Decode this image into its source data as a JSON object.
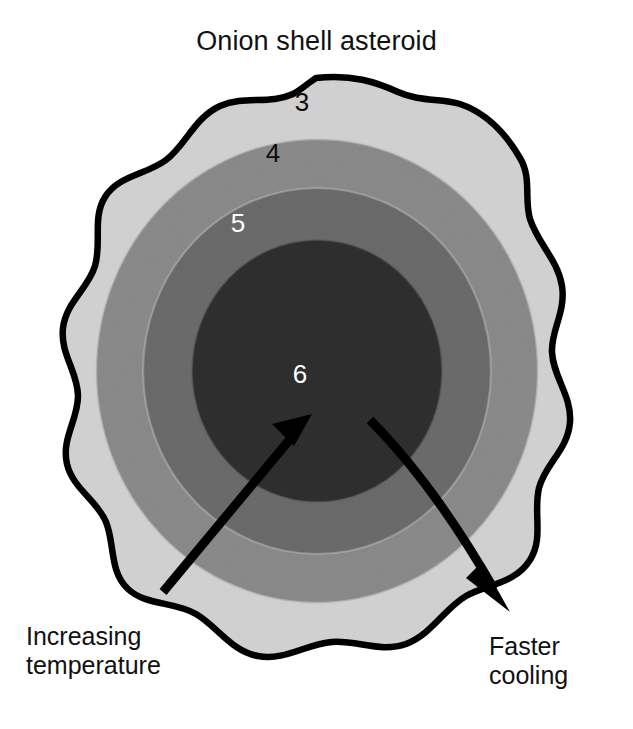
{
  "figure": {
    "title": "Onion shell asteroid",
    "type": "cross-section-diagram"
  },
  "shells": [
    {
      "id": "shell-3",
      "label": "3",
      "label_color": "#0d0d0d",
      "fill": "#d2d2d2",
      "position": "outermost shell",
      "radius_rel": 1.0
    },
    {
      "id": "shell-4",
      "label": "4",
      "label_color": "#0d0d0d",
      "fill": "#8a8a8a",
      "position": "second shell",
      "radius_rel": 0.84
    },
    {
      "id": "shell-5",
      "label": "5",
      "label_color": "#ffffff",
      "fill": "#6b6b6b",
      "position": "third shell",
      "radius_rel": 0.66
    },
    {
      "id": "shell-6",
      "label": "6",
      "label_color": "#ffffff",
      "fill": "#2f2f2f",
      "position": "core",
      "radius_rel": 0.47
    }
  ],
  "annotations": {
    "increasing_temperature": {
      "line1": "Increasing",
      "line2": "temperature",
      "direction": "inward toward core",
      "arrow_color": "#000000"
    },
    "faster_cooling": {
      "line1": "Faster",
      "line2": "cooling",
      "direction": "outward toward surface",
      "arrow_color": "#000000"
    }
  },
  "colors": {
    "background": "#ffffff",
    "outline": "#000000",
    "text": "#111111"
  }
}
